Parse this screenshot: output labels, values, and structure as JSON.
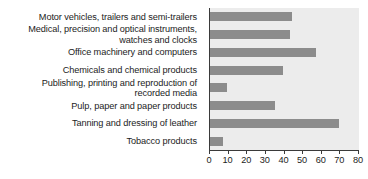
{
  "chart_data": {
    "type": "bar",
    "orientation": "horizontal",
    "title": "",
    "xlabel": "",
    "ylabel": "",
    "xlim": [
      0,
      80
    ],
    "xticks": [
      0,
      10,
      20,
      30,
      40,
      50,
      60,
      70,
      80
    ],
    "grid": false,
    "legend": null,
    "categories": [
      "Motor vehicles, trailers and semi-trailers",
      "Medical, precision and optical instruments,\nwatches and clocks",
      "Office machinery and computers",
      "Chemicals and chemical products",
      "Publishing, printing and reproduction of\nrecorded media",
      "Pulp, paper and paper products",
      "Tanning and dressing of leather",
      "Tobacco products"
    ],
    "values": [
      44,
      43,
      57,
      39,
      9,
      35,
      69,
      7
    ],
    "bar_color": "#8c8c8c",
    "plot_background": "#ececec",
    "axis_color": "#3a3a3a"
  }
}
